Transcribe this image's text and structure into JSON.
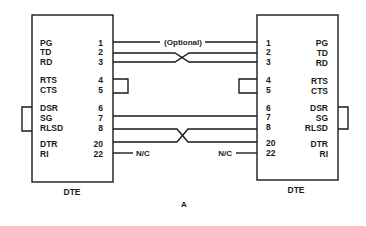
{
  "diagram": {
    "caption": "A",
    "optional_label": "(Optional)",
    "left_device": {
      "name": "DTE",
      "signals": [
        {
          "label": "PG",
          "pin": "1"
        },
        {
          "label": "TD",
          "pin": "2"
        },
        {
          "label": "RD",
          "pin": "3"
        },
        {
          "label": "RTS",
          "pin": "4"
        },
        {
          "label": "CTS",
          "pin": "5"
        },
        {
          "label": "DSR",
          "pin": "6"
        },
        {
          "label": "SG",
          "pin": "7"
        },
        {
          "label": "RLSD",
          "pin": "8"
        },
        {
          "label": "DTR",
          "pin": "20"
        },
        {
          "label": "RI",
          "pin": "22"
        }
      ],
      "nc_label": "N/C"
    },
    "right_device": {
      "name": "DTE",
      "signals": [
        {
          "label": "PG",
          "pin": "1"
        },
        {
          "label": "TD",
          "pin": "2"
        },
        {
          "label": "RD",
          "pin": "3"
        },
        {
          "label": "RTS",
          "pin": "4"
        },
        {
          "label": "CTS",
          "pin": "5"
        },
        {
          "label": "DSR",
          "pin": "6"
        },
        {
          "label": "SG",
          "pin": "7"
        },
        {
          "label": "RLSD",
          "pin": "8"
        },
        {
          "label": "DTR",
          "pin": "20"
        },
        {
          "label": "RI",
          "pin": "22"
        }
      ],
      "nc_label": "N/C"
    },
    "connections": [
      {
        "from": "1",
        "to": "1",
        "type": "straight",
        "note": "(Optional)"
      },
      {
        "from": "2",
        "to": "3",
        "type": "crossed"
      },
      {
        "from": "3",
        "to": "2",
        "type": "crossed"
      },
      {
        "from": "4",
        "to": "5",
        "type": "loopback-local"
      },
      {
        "from": "7",
        "to": "7",
        "type": "straight"
      },
      {
        "from": "8",
        "to": "20",
        "type": "crossed"
      },
      {
        "from": "20",
        "to": "8",
        "type": "crossed"
      },
      {
        "from": "6",
        "to": "8",
        "type": "loopback-local-outside"
      },
      {
        "from": "22",
        "to": "N/C",
        "type": "not-connected"
      }
    ]
  }
}
